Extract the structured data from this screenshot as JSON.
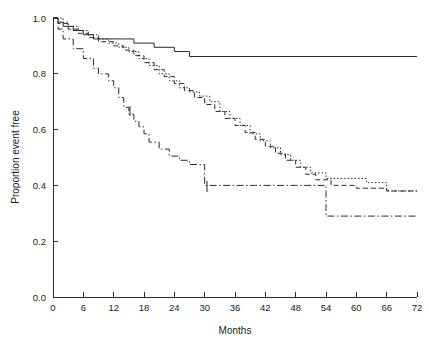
{
  "chart_data": {
    "type": "line",
    "title": "",
    "subtitle": "",
    "xlabel": "Months",
    "ylabel": "Proportion event free",
    "xlim": [
      0,
      72
    ],
    "ylim": [
      0.0,
      1.0
    ],
    "xticks": [
      0,
      6,
      12,
      18,
      24,
      30,
      36,
      42,
      48,
      54,
      60,
      66,
      72
    ],
    "yticks": [
      0.0,
      0.2,
      0.4,
      0.6,
      0.8,
      1.0
    ],
    "xtick_labels": [
      "0",
      "6",
      "12",
      "18",
      "24",
      "30",
      "36",
      "42",
      "48",
      "54",
      "60",
      "66",
      "72"
    ],
    "ytick_labels": [
      "0.0",
      "0.2",
      "0.4",
      "0.6",
      "0.8",
      "1.0"
    ],
    "grid": false,
    "legend": "none",
    "plot_kind": "kaplan-meier-step",
    "annotations": [],
    "series": [
      {
        "name": "curve-solid-flat",
        "style": "solid",
        "color": "#2b2b2b",
        "points": [
          [
            0,
            1.0
          ],
          [
            1,
            0.985
          ],
          [
            2,
            0.97
          ],
          [
            4,
            0.955
          ],
          [
            6,
            0.94
          ],
          [
            8,
            0.925
          ],
          [
            11,
            0.925
          ],
          [
            13,
            0.925
          ],
          [
            16,
            0.91
          ],
          [
            20,
            0.895
          ],
          [
            24,
            0.88
          ],
          [
            27,
            0.862
          ],
          [
            30,
            0.862
          ],
          [
            72,
            0.862
          ]
        ]
      },
      {
        "name": "curve-dotted",
        "style": "dotted",
        "color": "#2b2b2b",
        "points": [
          [
            0,
            1.0
          ],
          [
            2,
            0.985
          ],
          [
            3,
            0.97
          ],
          [
            5,
            0.955
          ],
          [
            7,
            0.94
          ],
          [
            9,
            0.925
          ],
          [
            11,
            0.91
          ],
          [
            13,
            0.895
          ],
          [
            15,
            0.88
          ],
          [
            17,
            0.855
          ],
          [
            19,
            0.83
          ],
          [
            21,
            0.8
          ],
          [
            23,
            0.775
          ],
          [
            25,
            0.75
          ],
          [
            27,
            0.735
          ],
          [
            29,
            0.72
          ],
          [
            31,
            0.7
          ],
          [
            33,
            0.665
          ],
          [
            35,
            0.64
          ],
          [
            37,
            0.615
          ],
          [
            39,
            0.585
          ],
          [
            41,
            0.56
          ],
          [
            43,
            0.535
          ],
          [
            45,
            0.51
          ],
          [
            47,
            0.49
          ],
          [
            49,
            0.465
          ],
          [
            51,
            0.445
          ],
          [
            54,
            0.425
          ],
          [
            58,
            0.425
          ],
          [
            62,
            0.41
          ],
          [
            66,
            0.38
          ],
          [
            72,
            0.38
          ]
        ]
      },
      {
        "name": "curve-dashed",
        "style": "dashed",
        "color": "#2b2b2b",
        "points": [
          [
            0,
            1.0
          ],
          [
            1,
            0.98
          ],
          [
            3,
            0.96
          ],
          [
            5,
            0.945
          ],
          [
            7,
            0.93
          ],
          [
            9,
            0.915
          ],
          [
            12,
            0.9
          ],
          [
            14,
            0.885
          ],
          [
            16,
            0.865
          ],
          [
            18,
            0.84
          ],
          [
            20,
            0.815
          ],
          [
            22,
            0.79
          ],
          [
            24,
            0.765
          ],
          [
            26,
            0.74
          ],
          [
            28,
            0.715
          ],
          [
            30,
            0.69
          ],
          [
            32,
            0.665
          ],
          [
            34,
            0.64
          ],
          [
            36,
            0.615
          ],
          [
            38,
            0.59
          ],
          [
            40,
            0.565
          ],
          [
            42,
            0.54
          ],
          [
            44,
            0.515
          ],
          [
            46,
            0.49
          ],
          [
            48,
            0.465
          ],
          [
            50,
            0.44
          ],
          [
            52,
            0.42
          ],
          [
            55,
            0.4
          ],
          [
            60,
            0.39
          ],
          [
            66,
            0.38
          ],
          [
            72,
            0.38
          ]
        ]
      },
      {
        "name": "curve-dash-dot",
        "style": "dash-dot",
        "color": "#2b2b2b",
        "points": [
          [
            0,
            1.0
          ],
          [
            1,
            0.96
          ],
          [
            2,
            0.925
          ],
          [
            4,
            0.89
          ],
          [
            6,
            0.855
          ],
          [
            8,
            0.82
          ],
          [
            9,
            0.8
          ],
          [
            11,
            0.775
          ],
          [
            12,
            0.75
          ],
          [
            13,
            0.715
          ],
          [
            14,
            0.68
          ],
          [
            15,
            0.655
          ],
          [
            16,
            0.63
          ],
          [
            17,
            0.61
          ],
          [
            18,
            0.585
          ],
          [
            19,
            0.555
          ],
          [
            21,
            0.53
          ],
          [
            23,
            0.505
          ],
          [
            25,
            0.49
          ],
          [
            27,
            0.475
          ],
          [
            30,
            0.475
          ],
          [
            30,
            0.4
          ],
          [
            40,
            0.4
          ],
          [
            48,
            0.4
          ],
          [
            52,
            0.4
          ],
          [
            54,
            0.29
          ],
          [
            62,
            0.29
          ],
          [
            72,
            0.29
          ]
        ]
      }
    ]
  },
  "axes": {
    "x_axis_name": "months-axis",
    "y_axis_name": "proportion-axis"
  }
}
